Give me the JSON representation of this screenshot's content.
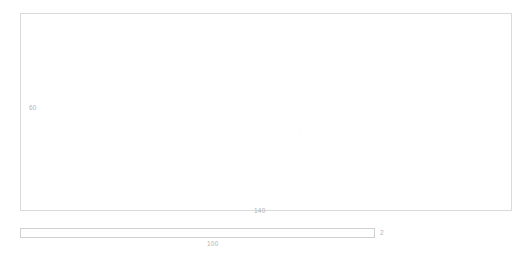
{
  "drawing": {
    "background_color": "#ffffff",
    "line_color": "#d9d9d9",
    "label_color": "#b4b4b4",
    "parts": [
      {
        "name": "main-plate",
        "shape": "rectangle",
        "width_label": "140",
        "height_label": "60"
      },
      {
        "name": "thin-bar",
        "shape": "rectangle",
        "length_label": "100",
        "thickness_label": "2"
      }
    ]
  },
  "labels": {
    "plate_height": "60",
    "plate_width": "140",
    "bar_length": "100",
    "bar_thickness": "2"
  },
  "chart_data": {
    "type": "table",
    "title": "",
    "xlabel": "",
    "ylabel": "",
    "categories": [
      "main-plate-width",
      "main-plate-height",
      "bar-length",
      "bar-thickness"
    ],
    "values": [
      140,
      60,
      100,
      2
    ],
    "annotations": [
      "140",
      "60",
      "100",
      "2"
    ],
    "grid": false,
    "legend": "none"
  }
}
